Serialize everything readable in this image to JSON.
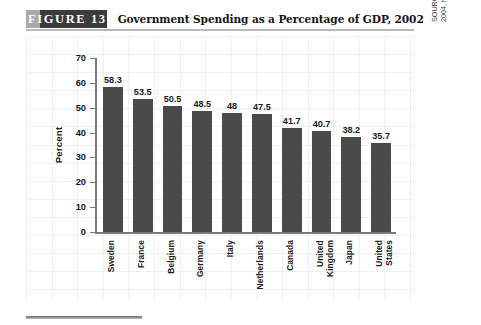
{
  "figure": {
    "tag": "FIGURE  13",
    "title": "Government Spending as a Percentage of GDP, 2002"
  },
  "source": {
    "prefix": "SOURCE: Organization for Economic Cooperation and Development, ",
    "italic": "OECD in Figures",
    "suffix": ", 2004, http://new.sourceoecd.org, accessed September 2004."
  },
  "chart_data": {
    "type": "bar",
    "title": "Government Spending as a Percentage of GDP, 2002",
    "xlabel": "",
    "ylabel": "Percent",
    "ylim": [
      0,
      70
    ],
    "yticks": [
      0,
      10,
      20,
      30,
      40,
      50,
      60,
      70
    ],
    "grid": true,
    "legend": false,
    "bar_color": "#4a4a4a",
    "categories": [
      "Sweden",
      "France",
      "Belgium",
      "Germany",
      "Italy",
      "Netherlands",
      "Canada",
      "United\nKingdom",
      "Japan",
      "United\nStates"
    ],
    "values": [
      58.3,
      53.5,
      50.5,
      48.5,
      48,
      47.5,
      41.7,
      40.7,
      38.2,
      35.7
    ],
    "value_labels": [
      "58.3",
      "53.5",
      "50.5",
      "48.5",
      "48",
      "47.5",
      "41.7",
      "40.7",
      "38.2",
      "35.7"
    ]
  }
}
